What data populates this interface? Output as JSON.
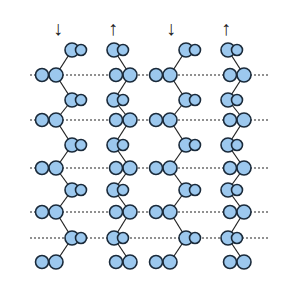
{
  "figure": {
    "strand_directions": [
      "down",
      "up",
      "down",
      "up"
    ],
    "arrows": [
      "↓",
      "↑",
      "↓",
      "↑"
    ],
    "atom_labels": [
      "N",
      "C",
      "R",
      "O",
      "C",
      "N",
      "C",
      "O",
      "C",
      "R"
    ],
    "colors": {
      "atom_fill": "#9cc8ee",
      "atom_stroke": "#1a2a3a",
      "bond": "#222222"
    }
  }
}
